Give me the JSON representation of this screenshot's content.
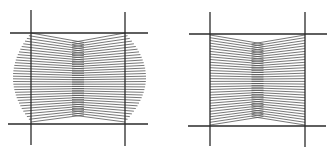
{
  "figure": {
    "width": 334,
    "height": 157,
    "background": "#ffffff",
    "line_color": "#2a2a2a",
    "hatch_color": "#555555",
    "panels": [
      {
        "id": "left-panel",
        "description": "barrel-distorted hatched grid cell",
        "verticals": [
          {
            "x": 31,
            "y1": 10,
            "y2": 145
          },
          {
            "x": 125,
            "y1": 12,
            "y2": 146
          }
        ],
        "horizontals": [
          {
            "y": 33,
            "x1": 10,
            "x2": 148
          },
          {
            "y": 124,
            "x1": 8,
            "x2": 148
          }
        ],
        "hatch": {
          "left_x": 31,
          "right_x": 125,
          "top_y": 33,
          "bottom_y": 122,
          "mid_top": 52,
          "mid_bottom": 108,
          "bulge_left": 13,
          "bulge_right": 146,
          "count": 34
        }
      },
      {
        "id": "right-panel",
        "description": "hatched grid cell confined to frame",
        "verticals": [
          {
            "x": 210,
            "y1": 12,
            "y2": 146
          },
          {
            "x": 305,
            "y1": 12,
            "y2": 147
          }
        ],
        "horizontals": [
          {
            "y": 34,
            "x1": 189,
            "x2": 327
          },
          {
            "y": 126,
            "x1": 188,
            "x2": 326
          }
        ],
        "hatch": {
          "left_x": 210,
          "right_x": 305,
          "top_y": 35,
          "bottom_y": 125,
          "mid_top": 53,
          "mid_bottom": 108,
          "bulge_left": 210,
          "bulge_right": 305,
          "count": 34
        }
      }
    ]
  }
}
